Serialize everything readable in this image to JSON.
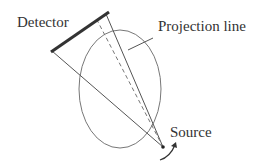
{
  "diagram": {
    "labels": {
      "detector": "Detector",
      "projection_line": "Projection line",
      "source": "Source"
    },
    "colors": {
      "background": "#ffffff",
      "line": "#555555",
      "detector": "#333333",
      "ellipse": "#777777",
      "text": "#333333"
    },
    "elements": [
      {
        "id": "detector",
        "type": "thick-line",
        "description": "Flat detector panel"
      },
      {
        "id": "object",
        "type": "ellipse",
        "description": "Scanned object cross-section"
      },
      {
        "id": "ray-left",
        "type": "line",
        "description": "Edge ray from source to detector left end"
      },
      {
        "id": "ray-right",
        "type": "line",
        "description": "Projection line from source to detector right end"
      },
      {
        "id": "central-ray",
        "type": "dashed-line",
        "description": "Central ray"
      },
      {
        "id": "source",
        "type": "point",
        "description": "X-ray source"
      },
      {
        "id": "rotation-arrow",
        "type": "curved-arrow",
        "description": "Source rotation direction"
      }
    ]
  }
}
